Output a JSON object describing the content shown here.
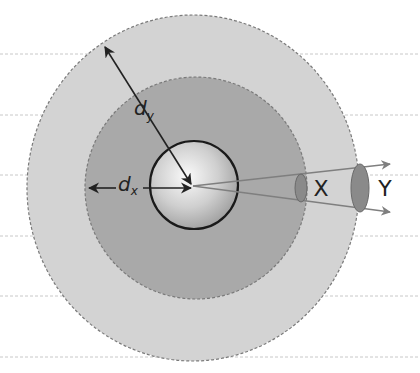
{
  "diagram": {
    "labels": {
      "dx_main": "d",
      "dx_sub": "x",
      "dy_main": "d",
      "dy_sub": "y",
      "near_area": "X",
      "far_area": "Y"
    },
    "colors": {
      "background": "#ffffff",
      "guide_line": "#c8c8c8",
      "outer_disc": "#d3d3d3",
      "middle_disc": "#a9a9a9",
      "disc_edge": "#7a7a7a",
      "sphere_light": "#f2f2f2",
      "sphere_dark": "#a0a0a0",
      "sphere_outline": "#1a1a1a",
      "arrow": "#222222",
      "ray": "#7f7f7f",
      "ellipse_fill": "#8a8a8a"
    },
    "guide_lines_y": [
      54,
      115,
      175,
      236,
      296,
      357
    ]
  }
}
